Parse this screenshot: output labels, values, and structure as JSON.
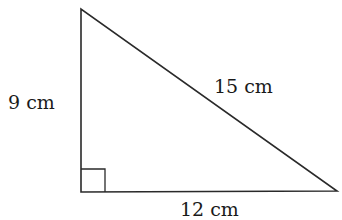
{
  "diagram": {
    "type": "right-triangle",
    "stroke_color": "#2a2a2a",
    "vertices": {
      "top": [
        81,
        9
      ],
      "right_angle": [
        81,
        192
      ],
      "bottom_right": [
        337,
        191
      ]
    },
    "right_angle_marker": true,
    "labels": {
      "left_side": "9 cm",
      "hypotenuse": "15 cm",
      "base": "12 cm"
    }
  }
}
